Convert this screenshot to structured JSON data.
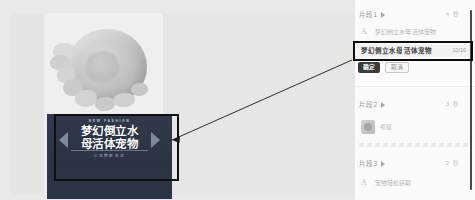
{
  "canvas": {
    "product_image_name": "jellyfish-photo",
    "banner": {
      "eyebrow": "NEW FASHION",
      "title_line1": "梦幻倒立水",
      "title_line2": "母活体宠物",
      "subtitle": "小宠物新生活"
    }
  },
  "annotation": {
    "box_name": "banner-highlight-box",
    "arrow_name": "callout-arrow"
  },
  "panel": {
    "clips": [
      {
        "label": "片段1",
        "meta": "4  秒"
      },
      {
        "label": "片段2",
        "meta": "3  秒"
      },
      {
        "label": "片段3",
        "meta": "2  秒"
      }
    ],
    "rows": [
      {
        "icon": "text-A-icon",
        "text": "梦幻倒立水母活体宠物"
      },
      {
        "icon": "text-A-icon",
        "text": "宠物轻松获取"
      }
    ],
    "thumb_row": {
      "label": "视频"
    },
    "edit": {
      "value": "梦幻倒立水母活体宠物",
      "counter": "10/10",
      "confirm_label": "确定",
      "cancel_label": "取消"
    }
  },
  "colors": {
    "page_bg": "#e9e9e7",
    "panel_bg": "#fbfbfb",
    "banner_bg": "#2b3444",
    "annotation": "#0d0d0d",
    "primary_button": "#3a3a3a"
  }
}
